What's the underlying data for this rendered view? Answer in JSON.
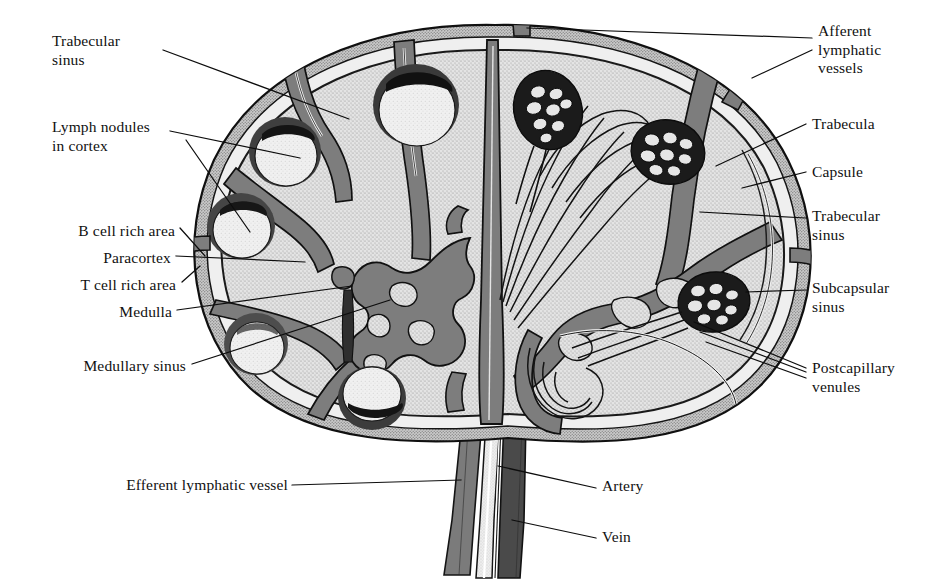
{
  "figure": {
    "kind": "anatomical-line-diagram"
  },
  "colors": {
    "ink": "#111111",
    "background": "#ffffff",
    "capsule": "#6f6f6f",
    "trabecula": "#7d7d7d",
    "cortex_parenchyma": "#d6d6d6",
    "nodule": "#e8e8e8",
    "nodule_rim": "#2b2b2b",
    "sinus_dark": "#5c5c5c",
    "artery": "#e2e2e2",
    "vein": "#4a4a4a",
    "efferent_vessel": "#787878",
    "leader_line": "#0d0d0d"
  },
  "labels": {
    "left": [
      {
        "id": "trabecular-sinus-left",
        "lines": [
          "Trabecular",
          "sinus"
        ],
        "x": 52,
        "y": 32,
        "align": "left"
      },
      {
        "id": "lymph-nodules-cortex",
        "lines": [
          "Lymph nodules",
          "in cortex"
        ],
        "x": 52,
        "y": 118,
        "align": "left"
      },
      {
        "id": "b-cell-rich-area",
        "lines": [
          "B cell rich area"
        ],
        "x": 175,
        "y": 232,
        "align": "right"
      },
      {
        "id": "paracortex",
        "lines": [
          "Paracortex"
        ],
        "x": 171,
        "y": 259,
        "align": "right"
      },
      {
        "id": "t-cell-rich-area",
        "lines": [
          "T cell rich area"
        ],
        "x": 176,
        "y": 286,
        "align": "right"
      },
      {
        "id": "medulla",
        "lines": [
          "Medulla"
        ],
        "x": 172,
        "y": 313,
        "align": "right"
      },
      {
        "id": "medullary-sinus",
        "lines": [
          "Medullary sinus"
        ],
        "x": 186,
        "y": 368,
        "align": "right"
      },
      {
        "id": "efferent-lymphatic-vessel",
        "lines": [
          "Efferent lymphatic vessel"
        ],
        "x": 286,
        "y": 486,
        "align": "right"
      }
    ],
    "right": [
      {
        "id": "afferent-lymphatic-vessels",
        "lines": [
          "Afferent",
          "lymphatic",
          "vessels"
        ],
        "x": 818,
        "y": 24,
        "align": "left"
      },
      {
        "id": "trabecula",
        "lines": [
          "Trabecula"
        ],
        "x": 812,
        "y": 118,
        "align": "left"
      },
      {
        "id": "capsule",
        "lines": [
          "Capsule"
        ],
        "x": 812,
        "y": 165,
        "align": "left"
      },
      {
        "id": "trabecular-sinus-right",
        "lines": [
          "Trabecular",
          "sinus"
        ],
        "x": 812,
        "y": 210,
        "align": "left"
      },
      {
        "id": "subcapsular-sinus",
        "lines": [
          "Subcapsular",
          "sinus"
        ],
        "x": 812,
        "y": 282,
        "align": "left"
      },
      {
        "id": "postcapillary-venules",
        "lines": [
          "Postcapillary",
          "venules"
        ],
        "x": 812,
        "y": 362,
        "align": "left"
      },
      {
        "id": "artery",
        "lines": [
          "Artery"
        ],
        "x": 602,
        "y": 484,
        "align": "left"
      },
      {
        "id": "vein",
        "lines": [
          "Vein"
        ],
        "x": 602,
        "y": 535,
        "align": "left"
      }
    ]
  },
  "structures": {
    "capsule": "outer fibrous capsule enclosing the node",
    "subcapsular_sinus": "pale channel immediately beneath the capsule",
    "trabeculae": "dark grey connective tissue partitions projecting inward",
    "trabecular_sinus": "lymph channel running alongside each trabecula",
    "cortex": "outer stippled zone containing lymph nodules",
    "lymph_nodules": 5,
    "paracortex": "T cell rich zone between cortex and medulla",
    "medulla": "central branching pale region with medullary sinuses",
    "afferent_vessels": 4,
    "postcapillary_venule_knots": 3,
    "hilum_vessels": [
      "efferent lymphatic vessel",
      "artery",
      "vein"
    ]
  }
}
